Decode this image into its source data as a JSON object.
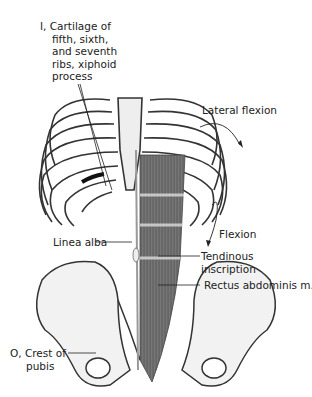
{
  "figure": {
    "labels": {
      "insertion": [
        "I, Cartilage of",
        "fifth, sixth,",
        "and seventh",
        "ribs, xiphoid",
        "process"
      ],
      "lateral_flexion": "Lateral flexion",
      "flexion": "Flexion",
      "linea_alba": "Linea alba",
      "tendinous_inscription": [
        "Tendinous",
        "inscription"
      ],
      "rectus_abdominis": "Rectus abdominis m.",
      "origin": [
        "O, Crest of",
        "pubis"
      ]
    },
    "colors": {
      "background": "#ffffff",
      "text": "#222222",
      "bone_outline": "#333333",
      "muscle": "#555555"
    }
  }
}
